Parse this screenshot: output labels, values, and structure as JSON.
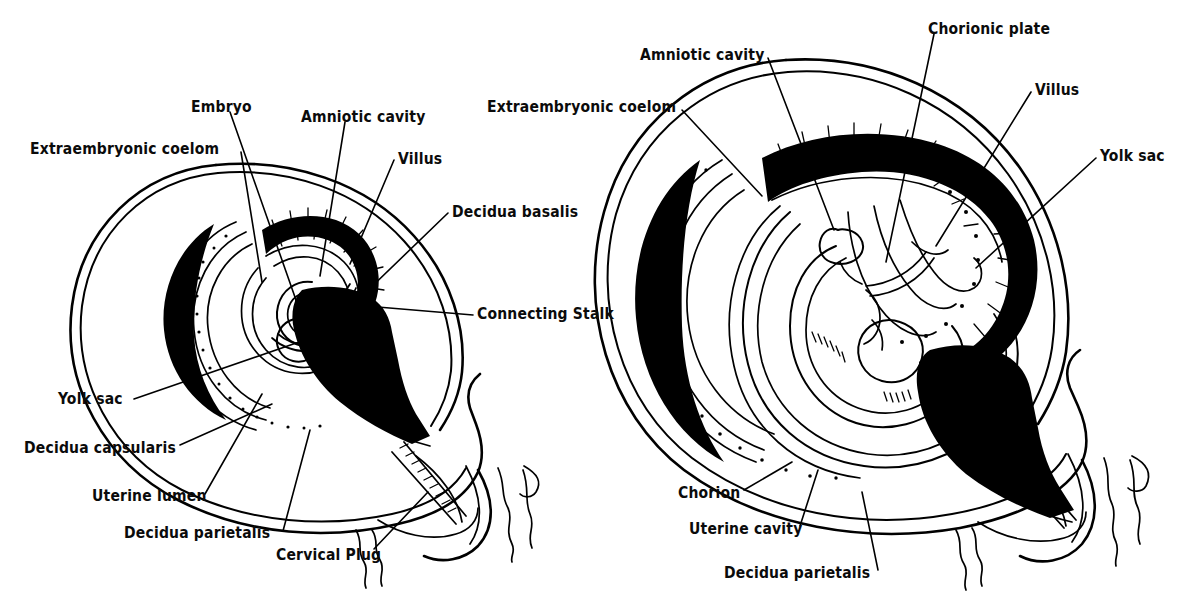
{
  "figure": {
    "background_color": "#ffffff",
    "ink_color": "#000000",
    "panels": [
      {
        "id": "left-panel",
        "name": "early-stage-uterus",
        "description": "Early embryo within uterus, cross-sectional line drawing",
        "labels": [
          {
            "key": "extraembryonic_coelom",
            "text": "Extraembryonic coelom",
            "x": 30,
            "y": 142
          },
          {
            "key": "embryo",
            "text": "Embryo",
            "x": 191,
            "y": 100
          },
          {
            "key": "amniotic_cavity",
            "text": "Amniotic cavity",
            "x": 301,
            "y": 110
          },
          {
            "key": "villus",
            "text": "Villus",
            "x": 398,
            "y": 152
          },
          {
            "key": "decidua_basalis",
            "text": "Decidua basalis",
            "x": 452,
            "y": 205
          },
          {
            "key": "connecting_stalk",
            "text": "Connecting Stalk",
            "x": 477,
            "y": 307
          },
          {
            "key": "yolk_sac",
            "text": "Yolk sac",
            "x": 58,
            "y": 392
          },
          {
            "key": "decidua_capsularis",
            "text": "Decidua capsularis",
            "x": 24,
            "y": 441
          },
          {
            "key": "uterine_lumen",
            "text": "Uterine lumen",
            "x": 92,
            "y": 489
          },
          {
            "key": "decidua_parietalis",
            "text": "Decidua parietalis",
            "x": 124,
            "y": 526
          },
          {
            "key": "cervical_plug",
            "text": "Cervical Plug",
            "x": 276,
            "y": 548
          }
        ]
      },
      {
        "id": "right-panel",
        "name": "later-stage-uterus",
        "description": "Later fetal stage within uterus with developed placenta",
        "labels": [
          {
            "key": "amniotic_cavity",
            "text": "Amniotic cavity",
            "x": 640,
            "y": 48
          },
          {
            "key": "chorionic_plate",
            "text": "Chorionic plate",
            "x": 928,
            "y": 22
          },
          {
            "key": "villus",
            "text": "Villus",
            "x": 1035,
            "y": 83
          },
          {
            "key": "extraembryonic_coelom",
            "text": "Extraembryonic coelom",
            "x": 487,
            "y": 100
          },
          {
            "key": "yolk_sac",
            "text": "Yolk sac",
            "x": 1100,
            "y": 149
          },
          {
            "key": "chorion",
            "text": "Chorion",
            "x": 678,
            "y": 486
          },
          {
            "key": "uterine_cavity",
            "text": "Uterine cavity",
            "x": 689,
            "y": 522
          },
          {
            "key": "decidua_parietalis",
            "text": "Decidua parietalis",
            "x": 724,
            "y": 566
          }
        ]
      }
    ]
  }
}
